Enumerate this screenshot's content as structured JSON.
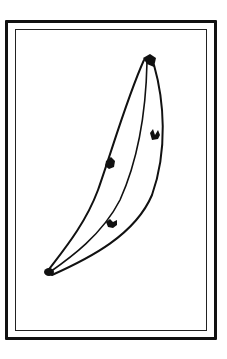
{
  "picture": {
    "subject": "banana",
    "style": "black ink line drawing",
    "frame": "double-line border",
    "colors": {
      "ink": "#111111",
      "paper": "#ffffff"
    },
    "spots": 3
  }
}
